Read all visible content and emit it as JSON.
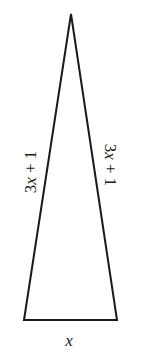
{
  "diagram": {
    "type": "isosceles-triangle",
    "colors": {
      "stroke": "#1a1a1a",
      "background": "#ffffff"
    },
    "vertices": {
      "apex": [
        71,
        14
      ],
      "base_left": [
        24,
        320
      ],
      "base_right": [
        117,
        320
      ]
    },
    "labels": {
      "left_side": {
        "coef": "3",
        "var": "x",
        "rest": " + 1"
      },
      "right_side": {
        "coef": "3",
        "var": "x",
        "rest": " + 1"
      },
      "base": "x"
    }
  }
}
